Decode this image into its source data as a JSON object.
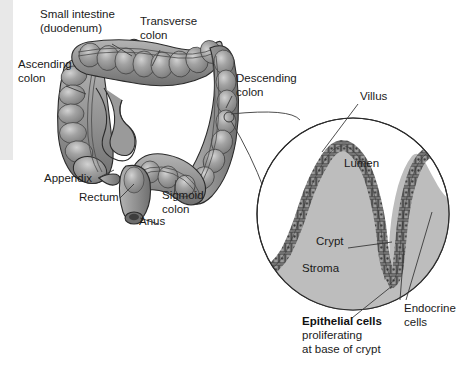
{
  "figure": {
    "background_color": "#ffffff",
    "margin_strip_color": "#e8e8e8"
  },
  "colors": {
    "colon_fill": "#8d8d8d",
    "colon_fill_light": "#a8a8a8",
    "colon_highlight": "#c2c2c2",
    "colon_outline": "#2b2b2b",
    "stroma_fill": "#bdbdbd",
    "epithelium_fill": "#8a8a8a",
    "epithelium_outline": "#333333",
    "lumen_fill": "#ffffff",
    "leader_line": "#3a3a3a",
    "text": "#1a1a1a"
  },
  "colon_labels": [
    {
      "id": "small-intestine",
      "line1": "Small intestine",
      "line2": "(duodenum)",
      "x": 40,
      "y": 18
    },
    {
      "id": "transverse-colon",
      "line1": "Transverse",
      "line2": "colon",
      "x": 140,
      "y": 25
    },
    {
      "id": "ascending-colon",
      "line1": "Ascending",
      "line2": "colon",
      "x": 18,
      "y": 68
    },
    {
      "id": "descending-colon",
      "line1": "Descending",
      "line2": "colon",
      "x": 236,
      "y": 82
    },
    {
      "id": "appendix",
      "line1": "Appendix",
      "line2": "",
      "x": 44,
      "y": 182
    },
    {
      "id": "rectum",
      "line1": "Rectum",
      "line2": "",
      "x": 79,
      "y": 201
    },
    {
      "id": "sigmoid-colon",
      "line1": "Sigmoid",
      "line2": "colon",
      "x": 162,
      "y": 199
    },
    {
      "id": "anus",
      "line1": "Anus",
      "line2": "",
      "x": 139,
      "y": 225
    }
  ],
  "detail_labels": [
    {
      "id": "villus",
      "line1": "Villus",
      "line2": "",
      "x": 360,
      "y": 100
    },
    {
      "id": "lumen",
      "line1": "Lumen",
      "line2": "",
      "x": 344,
      "y": 167
    },
    {
      "id": "crypt",
      "line1": "Crypt",
      "line2": "",
      "x": 316,
      "y": 245
    },
    {
      "id": "stroma",
      "line1": "Stroma",
      "line2": "",
      "x": 302,
      "y": 272
    },
    {
      "id": "endocrine-cells",
      "line1": "Endocrine",
      "line2": "cells",
      "x": 404,
      "y": 312
    }
  ],
  "callout": {
    "id": "epithelial-cells-callout",
    "bold_line": "Epithelial cells",
    "line2": "proliferating",
    "line3": "at base of crypt",
    "x": 302,
    "y": 325
  },
  "detail_circle": {
    "cx": 353,
    "cy": 214,
    "r": 96
  },
  "structures": {
    "colon_parts": [
      "ascending colon",
      "transverse colon",
      "descending colon",
      "sigmoid colon",
      "rectum",
      "anus",
      "appendix",
      "cecum",
      "duodenum stump"
    ],
    "detail_parts": [
      "villus",
      "crypt",
      "lumen",
      "stroma",
      "epithelium",
      "endocrine cells"
    ]
  }
}
